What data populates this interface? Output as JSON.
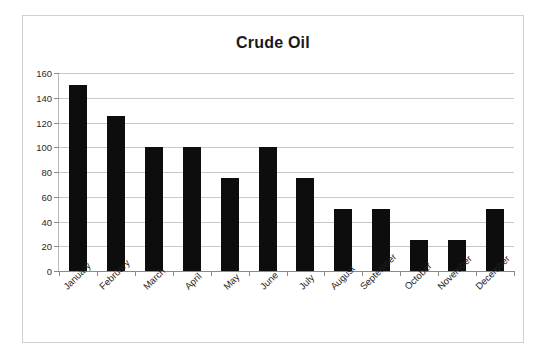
{
  "chart_data": {
    "type": "bar",
    "title": "Crude Oil",
    "xlabel": "",
    "ylabel": "",
    "categories": [
      "January",
      "February",
      "March",
      "April",
      "May",
      "June",
      "July",
      "August",
      "September",
      "October",
      "November",
      "December"
    ],
    "values": [
      150,
      125,
      100,
      100,
      75,
      100,
      75,
      50,
      50,
      25,
      25,
      50
    ],
    "series": [
      {
        "name": "Crude Oil",
        "values": [
          150,
          125,
          100,
          100,
          75,
          100,
          75,
          50,
          50,
          25,
          25,
          50
        ]
      }
    ],
    "ylim": [
      0,
      160
    ],
    "yticks": [
      0,
      20,
      40,
      60,
      80,
      100,
      120,
      140,
      160
    ],
    "ytick_labels": [
      "0",
      "20",
      "40",
      "60",
      "80",
      "100",
      "120",
      "140",
      "160"
    ],
    "grid": true,
    "grid_axis": "y",
    "legend": false,
    "legend_position": "none",
    "xtick_label_rotation": -45,
    "colors": {
      "bar": "#0d0d0d",
      "gridline": "#c9c9c9",
      "axis": "#8a8a8a",
      "frame": "#d0d0d0",
      "background": "#ffffff",
      "title_text": "#1a1a1a",
      "tick_text": "#2b2b2b"
    }
  }
}
